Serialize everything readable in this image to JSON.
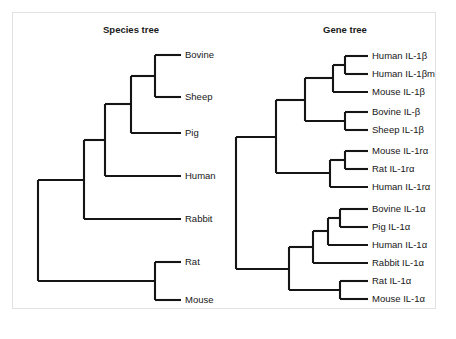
{
  "figure": {
    "background_color": "#ffffff",
    "border_color": "#e2e2e2",
    "line_color": "#151515",
    "text_color": "#171717"
  },
  "panels": [
    {
      "key": "species_tree",
      "title": "Species tree",
      "title_x": 131,
      "title_y": 33,
      "label_x": 185,
      "tip_x": 181,
      "tips": [
        {
          "label": "Bovine",
          "y": 55
        },
        {
          "label": "Sheep",
          "y": 97
        },
        {
          "label": "Pig",
          "y": 133
        },
        {
          "label": "Human",
          "y": 176
        },
        {
          "label": "Rabbit",
          "y": 219
        },
        {
          "label": "Rat",
          "y": 262
        },
        {
          "label": "Mouse",
          "y": 300
        }
      ],
      "nodes": [
        {
          "key": "bovine_sheep",
          "x": 155,
          "top": 55,
          "bottom": 97
        },
        {
          "key": "ruminant_pig",
          "x": 131,
          "top": 76,
          "bottom": 133
        },
        {
          "key": "artiodactyl_human",
          "x": 105,
          "top": 104,
          "bottom": 176
        },
        {
          "key": "primate_rabbit",
          "x": 84,
          "top": 140,
          "bottom": 219
        },
        {
          "key": "rat_mouse",
          "x": 155,
          "top": 262,
          "bottom": 300
        },
        {
          "key": "root",
          "x": 38,
          "top": 180,
          "bottom": 281
        }
      ],
      "connectors": [
        {
          "from_x": 155,
          "to_x": 181,
          "y": 55
        },
        {
          "from_x": 155,
          "to_x": 181,
          "y": 97
        },
        {
          "from_x": 131,
          "to_x": 155,
          "y": 76
        },
        {
          "from_x": 131,
          "to_x": 181,
          "y": 133
        },
        {
          "from_x": 105,
          "to_x": 131,
          "y": 104
        },
        {
          "from_x": 105,
          "to_x": 181,
          "y": 176
        },
        {
          "from_x": 84,
          "to_x": 105,
          "y": 140
        },
        {
          "from_x": 84,
          "to_x": 181,
          "y": 219
        },
        {
          "from_x": 155,
          "to_x": 181,
          "y": 262
        },
        {
          "from_x": 155,
          "to_x": 181,
          "y": 300
        },
        {
          "from_x": 38,
          "to_x": 84,
          "y": 180
        },
        {
          "from_x": 38,
          "to_x": 155,
          "y": 281
        }
      ]
    },
    {
      "key": "gene_tree",
      "title": "Gene tree",
      "title_x": 345,
      "title_y": 33,
      "label_x": 372,
      "tip_x": 368,
      "tips": [
        {
          "label": "Human IL-1β",
          "y": 56
        },
        {
          "label": "Human IL-1βm",
          "y": 74
        },
        {
          "label": "Mouse IL-1β",
          "y": 92
        },
        {
          "label": "Bovine IL-β",
          "y": 112
        },
        {
          "label": "Sheep IL-1β",
          "y": 130
        },
        {
          "label": "Mouse IL-1rα",
          "y": 151
        },
        {
          "label": "Rat IL-1rα",
          "y": 169
        },
        {
          "label": "Human IL-1rα",
          "y": 187
        },
        {
          "label": "Bovine IL-1α",
          "y": 209
        },
        {
          "label": "Pig IL-1α",
          "y": 227
        },
        {
          "label": "Human IL-1α",
          "y": 245
        },
        {
          "label": "Rabbit IL-1α",
          "y": 263
        },
        {
          "label": "Rat IL-1α",
          "y": 281
        },
        {
          "label": "Mouse IL-1α",
          "y": 299
        }
      ],
      "nodes": [
        {
          "key": "human_b_pair",
          "x": 345,
          "top": 56,
          "bottom": 74
        },
        {
          "key": "human_mouse_b",
          "x": 333,
          "top": 65,
          "bottom": 92
        },
        {
          "key": "bovine_sheep_b",
          "x": 345,
          "top": 112,
          "bottom": 130
        },
        {
          "key": "beta_clade",
          "x": 305,
          "top": 78,
          "bottom": 121
        },
        {
          "key": "mouse_rat_ra",
          "x": 345,
          "top": 151,
          "bottom": 169
        },
        {
          "key": "ra_clade",
          "x": 330,
          "top": 160,
          "bottom": 187
        },
        {
          "key": "beta_ra",
          "x": 276,
          "top": 100,
          "bottom": 173
        },
        {
          "key": "bovine_pig_a",
          "x": 340,
          "top": 209,
          "bottom": 227
        },
        {
          "key": "bovine_pig_human",
          "x": 328,
          "top": 218,
          "bottom": 245
        },
        {
          "key": "alpha_upper",
          "x": 313,
          "top": 231,
          "bottom": 263
        },
        {
          "key": "rat_mouse_a",
          "x": 340,
          "top": 281,
          "bottom": 299
        },
        {
          "key": "alpha_clade",
          "x": 289,
          "top": 247,
          "bottom": 290
        },
        {
          "key": "root",
          "x": 236,
          "top": 137,
          "bottom": 269
        }
      ],
      "connectors": [
        {
          "from_x": 345,
          "to_x": 368,
          "y": 56
        },
        {
          "from_x": 345,
          "to_x": 368,
          "y": 74
        },
        {
          "from_x": 333,
          "to_x": 345,
          "y": 65
        },
        {
          "from_x": 333,
          "to_x": 368,
          "y": 92
        },
        {
          "from_x": 305,
          "to_x": 333,
          "y": 78
        },
        {
          "from_x": 345,
          "to_x": 368,
          "y": 112
        },
        {
          "from_x": 345,
          "to_x": 368,
          "y": 130
        },
        {
          "from_x": 305,
          "to_x": 345,
          "y": 121
        },
        {
          "from_x": 276,
          "to_x": 305,
          "y": 100
        },
        {
          "from_x": 345,
          "to_x": 368,
          "y": 151
        },
        {
          "from_x": 345,
          "to_x": 368,
          "y": 169
        },
        {
          "from_x": 330,
          "to_x": 345,
          "y": 160
        },
        {
          "from_x": 330,
          "to_x": 368,
          "y": 187
        },
        {
          "from_x": 276,
          "to_x": 330,
          "y": 173
        },
        {
          "from_x": 236,
          "to_x": 276,
          "y": 137
        },
        {
          "from_x": 340,
          "to_x": 368,
          "y": 209
        },
        {
          "from_x": 340,
          "to_x": 368,
          "y": 227
        },
        {
          "from_x": 328,
          "to_x": 340,
          "y": 218
        },
        {
          "from_x": 328,
          "to_x": 368,
          "y": 245
        },
        {
          "from_x": 313,
          "to_x": 328,
          "y": 231
        },
        {
          "from_x": 313,
          "to_x": 368,
          "y": 263
        },
        {
          "from_x": 289,
          "to_x": 313,
          "y": 247
        },
        {
          "from_x": 340,
          "to_x": 368,
          "y": 281
        },
        {
          "from_x": 340,
          "to_x": 368,
          "y": 299
        },
        {
          "from_x": 289,
          "to_x": 340,
          "y": 290
        },
        {
          "from_x": 236,
          "to_x": 289,
          "y": 269
        }
      ]
    }
  ]
}
